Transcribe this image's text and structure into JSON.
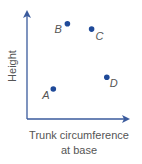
{
  "chart_data": {
    "type": "scatter",
    "title": "",
    "xlabel": "Trunk circumference at base",
    "xlabel_lines": [
      "Trunk circumference",
      "at base"
    ],
    "ylabel": "Height",
    "xlim": [
      0,
      1
    ],
    "ylim": [
      0,
      1
    ],
    "grid": false,
    "legend": null,
    "ticks": "none",
    "points": [
      {
        "label": "A",
        "x": 0.26,
        "y": 0.28
      },
      {
        "label": "B",
        "x": 0.4,
        "y": 0.89
      },
      {
        "label": "C",
        "x": 0.64,
        "y": 0.84
      },
      {
        "label": "D",
        "x": 0.79,
        "y": 0.39
      }
    ]
  },
  "colors": {
    "axis": "#3a5a9c",
    "point": "#1f4a99",
    "text": "#555555"
  }
}
